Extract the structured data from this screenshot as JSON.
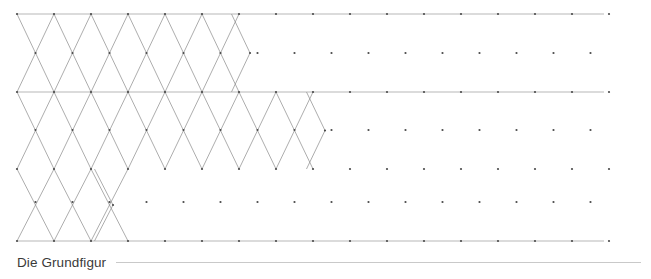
{
  "page": {
    "width": 651,
    "height": 279,
    "background": "#ffffff"
  },
  "caption": {
    "text": "Die Grundfigur",
    "color": "#3a3a3a",
    "rule_color": "#c9c9c9"
  },
  "figure": {
    "name": "triangular-hexagonal-lattice",
    "line_color": "#8a8a8a",
    "rule_color": "#9a9a9a",
    "dot_color": "#4a4a4a",
    "stroke_width": 0.7,
    "dot_radius": 1.1,
    "lattice": {
      "origin_x": 17,
      "origin_y": 14,
      "col_step": 37,
      "row_step": 38.8,
      "cols": 17,
      "rows": 7,
      "row_y": [
        14,
        53,
        92,
        130,
        169,
        202,
        241
      ]
    },
    "horizontal_rules": [
      {
        "y": 14,
        "x1": 17,
        "x2": 604
      },
      {
        "y": 92,
        "x1": 17,
        "x2": 604
      },
      {
        "y": 241,
        "x1": 17,
        "x2": 604
      }
    ],
    "zigzag_rows": [
      {
        "name": "top-band",
        "y_top": 14,
        "y_bottom": 92,
        "x_start": 17,
        "peaks": 6,
        "cap_x": 250
      },
      {
        "name": "middle-band",
        "y_top": 92,
        "y_bottom": 169,
        "x_start": 17,
        "peaks": 8,
        "cap_x": 325
      },
      {
        "name": "bottom-band",
        "y_top": 169,
        "y_bottom": 241,
        "x_start": 17,
        "peaks": 3,
        "cap_x": 113
      }
    ]
  }
}
